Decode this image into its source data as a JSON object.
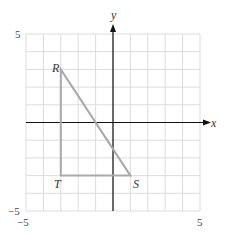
{
  "diagram": {
    "type": "coordinate-plane",
    "grid": {
      "xmin": -5,
      "xmax": 5,
      "ymin": -5,
      "ymax": 5,
      "step": 1
    },
    "axes": {
      "x_label": "x",
      "y_label": "y"
    },
    "tick_labels": {
      "y_top": "5",
      "y_bottom": "−5",
      "x_left": "−5",
      "x_right": "5"
    },
    "triangle": {
      "points": [
        {
          "name": "R",
          "x": -3,
          "y": 3
        },
        {
          "name": "S",
          "x": 1,
          "y": -3
        },
        {
          "name": "T",
          "x": -3,
          "y": -3
        }
      ],
      "stroke_color": "#a9a9a9"
    },
    "colors": {
      "grid": "#dcdcdc",
      "axis": "#111111"
    }
  }
}
